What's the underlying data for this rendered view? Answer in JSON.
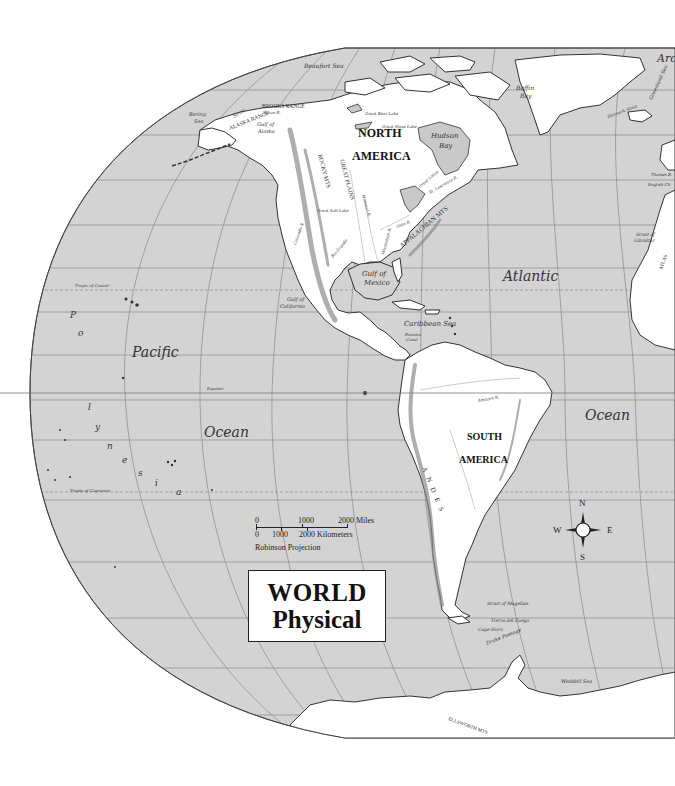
{
  "map": {
    "title": "WORLD",
    "subtitle": "Physical",
    "projection": "Robinson Projection",
    "colors": {
      "ocean": "#d3d3d3",
      "land": "#ffffff",
      "outline": "#333333"
    }
  },
  "scale_bar": {
    "miles": {
      "ticks": [
        "0",
        "1000",
        "2000 Miles"
      ]
    },
    "kilometers": {
      "ticks": [
        "0",
        "1000",
        "2000 Kilometers"
      ]
    }
  },
  "compass": {
    "north": "N",
    "south": "S",
    "east": "E",
    "west": "W"
  },
  "continents": {
    "north_america_1": "NORTH",
    "north_america_2": "AMERICA",
    "south_america_1": "SOUTH",
    "south_america_2": "AMERICA"
  },
  "oceans": {
    "pacific_1": "Pacific",
    "pacific_2": "Ocean",
    "atlantic_1": "Atlantic",
    "atlantic_2": "Ocean",
    "arctic_partial": "Arc",
    "polynesia": [
      "P",
      "o",
      "l",
      "y",
      "n",
      "e",
      "s",
      "i",
      "a"
    ]
  },
  "water_bodies": {
    "beaufort": "Beaufort   Sea",
    "bering_1": "Bering",
    "bering_2": "Sea",
    "gulf_alaska_1": "Gulf of",
    "gulf_alaska_2": "Alaska",
    "hudson_1": "Hudson",
    "hudson_2": "Bay",
    "baffin_1": "Baffin",
    "baffin_2": "Bay",
    "great_bear": "Great Bear Lake",
    "great_slave": "Great Slave Lake",
    "gulf_mexico_1": "Gulf of",
    "gulf_mexico_2": "Mexico",
    "gulf_california_1": "Gulf of",
    "gulf_california_2": "California",
    "caribbean": "Caribbean   Sea",
    "panama_1": "Panama",
    "panama_2": "Canal",
    "denmark_strait": "Denmark Strait",
    "greenland_sea": "Greenland Sea",
    "thames": "Thames R.",
    "english_channel": "English Ch.",
    "gibraltar_1": "Strait of",
    "gibraltar_2": "Gibraltar",
    "magellan": "Strait of Magellan",
    "tierra": "Tierra del Fuego",
    "cape_horn": "Cape Horn",
    "drake": "Drake Passage",
    "weddell": "Weddell Sea",
    "bering_strait": "Strait"
  },
  "lines": {
    "tropic_cancer": "Tropic of Cancer",
    "tropic_capricorn": "Tropic of Capricorn",
    "equator": "Equator"
  },
  "features": {
    "brooks": "BROOKS  RANGE",
    "alaska_range": "ALASKA  RANGE",
    "yukon": "Yukon R.",
    "rocky": "ROCKY  MTS",
    "great_plains": "GREAT  PLAINS",
    "appalachian": "APPALACHIAN  MTS",
    "missouri": "Missouri R.",
    "mississippi": "Mississippi R.",
    "ohio": "Ohio R.",
    "st_lawrence": "St. Lawrence R.",
    "great_lakes": "Great Lakes",
    "great_salt": "Great Salt Lake",
    "colorado": "Colorado R.",
    "rio_grande": "Rio Grande",
    "amazon": "Amazon R.",
    "andes": "ANDES",
    "atlas": "ATLAS",
    "ellsworth": "ELLSWORTH MTS"
  }
}
